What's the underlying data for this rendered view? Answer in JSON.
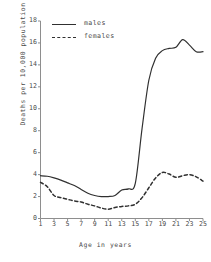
{
  "chart_data": {
    "type": "line",
    "title": "",
    "xlabel": "Age in years",
    "ylabel": "Deaths per 10,000 population",
    "xlim": [
      1,
      25
    ],
    "ylim": [
      0,
      18
    ],
    "xticks": [
      1,
      3,
      5,
      7,
      9,
      11,
      13,
      15,
      17,
      19,
      21,
      23,
      25
    ],
    "yticks": [
      0,
      2,
      4,
      6,
      8,
      10,
      12,
      14,
      16,
      18
    ],
    "grid": false,
    "legend_position": "top-left-inside",
    "x": [
      1,
      2,
      3,
      4,
      5,
      6,
      7,
      8,
      9,
      10,
      11,
      12,
      13,
      14,
      15,
      16,
      17,
      18,
      19,
      20,
      21,
      22,
      23,
      24,
      25
    ],
    "series": [
      {
        "name": "males",
        "style": "solid",
        "color": "#303030",
        "values": [
          3.9,
          3.85,
          3.7,
          3.5,
          3.25,
          3.0,
          2.65,
          2.3,
          2.1,
          2.0,
          2.0,
          2.1,
          2.6,
          2.7,
          3.2,
          8.2,
          12.6,
          14.6,
          15.3,
          15.5,
          15.6,
          16.3,
          15.8,
          15.2,
          15.2
        ]
      },
      {
        "name": "females",
        "style": "dashed",
        "color": "#303030",
        "values": [
          3.3,
          2.9,
          2.1,
          1.9,
          1.75,
          1.6,
          1.5,
          1.3,
          1.15,
          0.95,
          0.85,
          1.0,
          1.1,
          1.15,
          1.3,
          1.9,
          2.8,
          3.7,
          4.2,
          4.05,
          3.75,
          3.9,
          4.0,
          3.8,
          3.4
        ]
      }
    ]
  },
  "legend": {
    "items": [
      {
        "label": "males",
        "style": "solid"
      },
      {
        "label": "females",
        "style": "dashed"
      }
    ]
  },
  "axes": {
    "y_label": "Deaths per 10,000 population",
    "x_label": "Age in years"
  }
}
